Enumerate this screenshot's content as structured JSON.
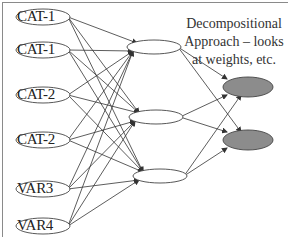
{
  "caption": {
    "line1": "Decompositional",
    "line2": "Approach – looks",
    "line3": "at weights, etc."
  },
  "input_nodes": [
    {
      "label": "CAT-1",
      "cx": 43,
      "cy": 17
    },
    {
      "label": "CAT-1",
      "cx": 43,
      "cy": 50
    },
    {
      "label": "CAT-2",
      "cx": 43,
      "cy": 95
    },
    {
      "label": "CAT-2",
      "cx": 43,
      "cy": 140
    },
    {
      "label": "VAR3",
      "cx": 43,
      "cy": 189
    },
    {
      "label": "VAR4",
      "cx": 43,
      "cy": 226
    }
  ],
  "hidden_nodes": [
    {
      "cx": 154,
      "cy": 47
    },
    {
      "cx": 156,
      "cy": 117
    },
    {
      "cx": 160,
      "cy": 176
    }
  ],
  "output_nodes": [
    {
      "cx": 248,
      "cy": 87
    },
    {
      "cx": 248,
      "cy": 140
    }
  ],
  "colors": {
    "edge": "#333333",
    "output_fill": "#8c8c8c",
    "border": "#8a8a8a"
  }
}
